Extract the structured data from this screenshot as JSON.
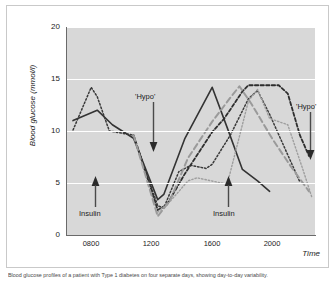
{
  "figure": {
    "caption": "Blood glucose profiles of a patient with Type 1 diabetes on four separate days, showing day-to-day variability."
  },
  "annotations": {
    "hypo_left": "'Hypo'",
    "hypo_right": "'Hypo'",
    "insulin_left": "Insulin",
    "insulin_right": "Insulin"
  },
  "chart_data": {
    "type": "line",
    "title": "",
    "xlabel": "Time",
    "ylabel": "Blood glucose (mmol/l)",
    "xlim": [
      600,
      2240
    ],
    "ylim": [
      0,
      20
    ],
    "yticks": [
      0,
      5,
      10,
      15,
      20
    ],
    "ytick_labels": [
      "0",
      "5",
      "10",
      "15",
      "20"
    ],
    "xticks": [
      800,
      1200,
      1600,
      2000
    ],
    "xtick_labels": [
      "0800",
      "1200",
      "1600",
      "2000"
    ],
    "grid": "horizontal-white",
    "legend": "none",
    "plot_bg": "#d8d8d8",
    "series": [
      {
        "name": "day-1-solid",
        "style": "solid",
        "color": "#333333",
        "width": 1.6,
        "x": [
          640,
          800,
          900,
          1040,
          1200,
          1240,
          1380,
          1560,
          1660,
          1760,
          1860,
          1940
        ],
        "y": [
          11.0,
          12.0,
          10.6,
          9.3,
          3.4,
          3.9,
          9.3,
          14.2,
          10.3,
          6.3,
          5.2,
          4.2
        ]
      },
      {
        "name": "day-2-dotted-dark",
        "style": "dotted",
        "color": "#3a3a3a",
        "width": 1.5,
        "x": [
          640,
          760,
          800,
          880,
          1040,
          1200,
          1240,
          1340,
          1420,
          1520,
          1560,
          1680,
          1800,
          1860,
          1940,
          2060,
          2140
        ],
        "y": [
          10.1,
          14.2,
          13.3,
          10.0,
          9.6,
          2.8,
          2.6,
          6.1,
          6.7,
          6.4,
          6.8,
          9.6,
          13.1,
          13.9,
          11.6,
          7.7,
          5.1
        ]
      },
      {
        "name": "day-3-dashed-dark",
        "style": "dashed",
        "color": "#2e2e2e",
        "width": 1.8,
        "x": [
          1040,
          1200,
          1260,
          1380,
          1560,
          1640,
          1760,
          1800,
          2000,
          2060,
          2140,
          2200
        ],
        "y": [
          9.6,
          2.4,
          2.9,
          5.9,
          9.9,
          11.2,
          13.8,
          14.4,
          14.4,
          13.6,
          9.6,
          7.6
        ]
      },
      {
        "name": "day-4-dashed-gray",
        "style": "long-dash",
        "color": "#9a9a9a",
        "width": 2.0,
        "x": [
          1040,
          1200,
          1280,
          1400,
          1560,
          1680,
          1740,
          1820,
          1960,
          2080,
          2200
        ],
        "y": [
          9.6,
          1.8,
          3.3,
          7.4,
          10.9,
          13.2,
          14.3,
          12.6,
          9.2,
          6.6,
          4.2
        ]
      },
      {
        "name": "day-5-dotted-light",
        "style": "dotted-light",
        "color": "#9e9e9e",
        "width": 1.4,
        "x": [
          1200,
          1280,
          1400,
          1460,
          1620,
          1660,
          1800,
          1860,
          1940,
          2060,
          2160,
          2220
        ],
        "y": [
          2.2,
          3.2,
          5.2,
          5.5,
          5.0,
          4.9,
          12.9,
          14.0,
          11.2,
          10.6,
          6.3,
          3.6
        ]
      }
    ]
  }
}
